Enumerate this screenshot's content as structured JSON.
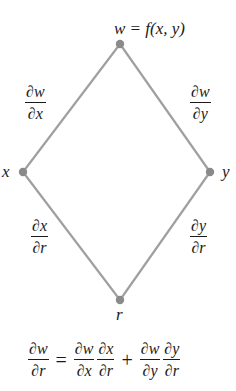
{
  "diagram": {
    "type": "chain-rule-tree-diagram",
    "colors": {
      "edge": "#a0a0a0",
      "node": "#8a8a8a",
      "text": "#1a1a1a",
      "background": "#ffffff"
    },
    "nodes": {
      "top": {
        "id": "w",
        "label": "w = f(x, y)",
        "x": 120,
        "y": 44
      },
      "left": {
        "id": "x",
        "label": "x",
        "x": 23,
        "y": 172
      },
      "right": {
        "id": "y",
        "label": "y",
        "x": 210,
        "y": 172
      },
      "bottom": {
        "id": "r",
        "label": "r",
        "x": 120,
        "y": 300
      }
    },
    "edges": [
      {
        "from": "w",
        "to": "x",
        "label_num": "∂w",
        "label_den": "∂x"
      },
      {
        "from": "w",
        "to": "y",
        "label_num": "∂w",
        "label_den": "∂y"
      },
      {
        "from": "x",
        "to": "r",
        "label_num": "∂x",
        "label_den": "∂r"
      },
      {
        "from": "y",
        "to": "r",
        "label_num": "∂y",
        "label_den": "∂r"
      }
    ],
    "equation": {
      "lhs": {
        "num": "∂w",
        "den": "∂r"
      },
      "equals": "=",
      "term1": [
        {
          "num": "∂w",
          "den": "∂x"
        },
        {
          "num": "∂x",
          "den": "∂r"
        }
      ],
      "plus": "+",
      "term2": [
        {
          "num": "∂w",
          "den": "∂y"
        },
        {
          "num": "∂y",
          "den": "∂r"
        }
      ]
    }
  }
}
